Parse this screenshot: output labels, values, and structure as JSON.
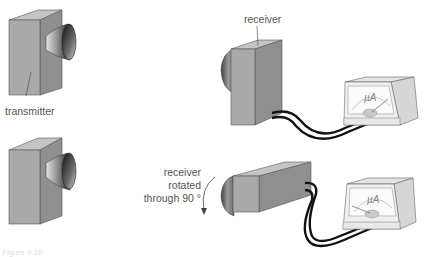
{
  "diagram": {
    "labels": {
      "transmitter": "transmitter",
      "receiver": "receiver",
      "rotated_line1": "receiver",
      "rotated_line2": "rotated",
      "rotated_line3": "through 90 °",
      "meter_unit": "µA"
    },
    "caption": "Figure 9.10",
    "colors": {
      "box_front": "#a9a9a9",
      "box_side": "#8f8f8f",
      "box_top": "#c4c4c4",
      "horn_dark": "#2a2a2a",
      "wire": "#111111",
      "meter_body": "#eeeeee",
      "meter_side": "#d6d6d6"
    },
    "components": [
      {
        "id": "transmitter-top",
        "type": "transmitter"
      },
      {
        "id": "transmitter-bottom",
        "type": "transmitter"
      },
      {
        "id": "receiver-vertical",
        "type": "receiver",
        "orientation": "vertical"
      },
      {
        "id": "receiver-rotated",
        "type": "receiver",
        "orientation": "horizontal (rotated 90°)"
      },
      {
        "id": "microammeter-top",
        "type": "microammeter"
      },
      {
        "id": "microammeter-bottom",
        "type": "microammeter"
      }
    ]
  }
}
